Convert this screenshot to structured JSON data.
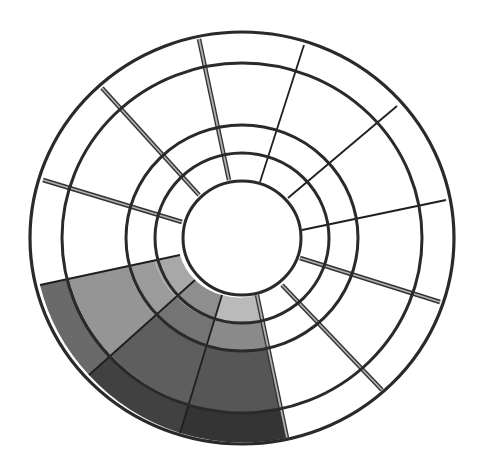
{
  "diagram": {
    "type": "segmented-polar-ring",
    "center": [
      242,
      238
    ],
    "rings": [
      {
        "id": "inner-hub",
        "rx": 59,
        "ry": 57
      },
      {
        "id": "ring-1-outer",
        "rx": 87,
        "ry": 85
      },
      {
        "id": "ring-2-outer",
        "rx": 116,
        "ry": 113
      },
      {
        "id": "ring-3-outer",
        "rx": 180,
        "ry": 175
      },
      {
        "id": "ring-4-outer",
        "rx": 212,
        "ry": 206
      }
    ],
    "ring_stroke": "#2a2a2a",
    "spokes": [
      {
        "from": [
          229,
          180
        ],
        "to": [
          199,
          39
        ],
        "style": "double"
      },
      {
        "from": [
          260,
          182
        ],
        "to": [
          304,
          45
        ],
        "style": "thin"
      },
      {
        "from": [
          288,
          198
        ],
        "to": [
          397,
          106
        ],
        "style": "thin"
      },
      {
        "from": [
          302,
          230
        ],
        "to": [
          446,
          200
        ],
        "style": "thin"
      },
      {
        "from": [
          300,
          258
        ],
        "to": [
          440,
          302
        ],
        "style": "double"
      },
      {
        "from": [
          282,
          285
        ],
        "to": [
          382,
          390
        ],
        "style": "double"
      },
      {
        "from": [
          257,
          295
        ],
        "to": [
          287,
          438
        ],
        "style": "double"
      },
      {
        "from": [
          222,
          295
        ],
        "to": [
          180,
          433
        ],
        "style": "thin"
      },
      {
        "from": [
          195,
          280
        ],
        "to": [
          89,
          375
        ],
        "style": "thin"
      },
      {
        "from": [
          180,
          255
        ],
        "to": [
          40,
          285
        ],
        "style": "thin"
      },
      {
        "from": [
          182,
          222
        ],
        "to": [
          43,
          180
        ],
        "style": "double"
      },
      {
        "from": [
          199,
          195
        ],
        "to": [
          102,
          88
        ],
        "style": "double"
      }
    ],
    "shaded_cells": [
      {
        "sector": "A",
        "ring": 1,
        "color": "#a8a8a8",
        "pts": [
          [
            180,
            255
          ],
          [
            154,
            260
          ],
          [
            176,
            297
          ],
          [
            195,
            280
          ]
        ]
      },
      {
        "sector": "A",
        "ring": 2,
        "color": "#9b9b9b",
        "pts": [
          [
            154,
            260
          ],
          [
            128,
            266
          ],
          [
            155,
            315
          ],
          [
            176,
            297
          ]
        ]
      },
      {
        "sector": "A",
        "ring": 3,
        "color": "#959595",
        "pts": [
          [
            128,
            266
          ],
          [
            69,
            279
          ],
          [
            111,
            355
          ],
          [
            155,
            315
          ]
        ]
      },
      {
        "sector": "A",
        "ring": 4,
        "color": "#6a6a6a",
        "pts": [
          [
            69,
            279
          ],
          [
            40,
            285
          ],
          [
            89,
            375
          ],
          [
            111,
            355
          ]
        ]
      },
      {
        "sector": "B",
        "ring": 1,
        "color": "#8e8e8e",
        "pts": [
          [
            195,
            280
          ],
          [
            176,
            297
          ],
          [
            215,
            320
          ],
          [
            222,
            295
          ]
        ]
      },
      {
        "sector": "B",
        "ring": 2,
        "color": "#747474",
        "pts": [
          [
            176,
            297
          ],
          [
            155,
            315
          ],
          [
            207,
            346
          ],
          [
            215,
            320
          ]
        ]
      },
      {
        "sector": "B",
        "ring": 3,
        "color": "#5e5e5e",
        "pts": [
          [
            155,
            315
          ],
          [
            111,
            355
          ],
          [
            189,
            404
          ],
          [
            207,
            346
          ]
        ]
      },
      {
        "sector": "B",
        "ring": 4,
        "color": "#414141",
        "pts": [
          [
            111,
            355
          ],
          [
            89,
            375
          ],
          [
            180,
            433
          ],
          [
            189,
            404
          ]
        ]
      },
      {
        "sector": "C",
        "ring": 1,
        "color": "#bababa",
        "pts": [
          [
            222,
            295
          ],
          [
            215,
            320
          ],
          [
            262,
            321
          ],
          [
            257,
            295
          ]
        ]
      },
      {
        "sector": "C",
        "ring": 2,
        "color": "#8a8a8a",
        "pts": [
          [
            215,
            320
          ],
          [
            207,
            346
          ],
          [
            268,
            348
          ],
          [
            262,
            321
          ]
        ]
      },
      {
        "sector": "C",
        "ring": 3,
        "color": "#565656",
        "pts": [
          [
            207,
            346
          ],
          [
            189,
            404
          ],
          [
            281,
            408
          ],
          [
            268,
            348
          ]
        ]
      },
      {
        "sector": "C",
        "ring": 4,
        "color": "#343434",
        "pts": [
          [
            189,
            404
          ],
          [
            180,
            433
          ],
          [
            287,
            438
          ],
          [
            281,
            408
          ]
        ]
      }
    ]
  }
}
